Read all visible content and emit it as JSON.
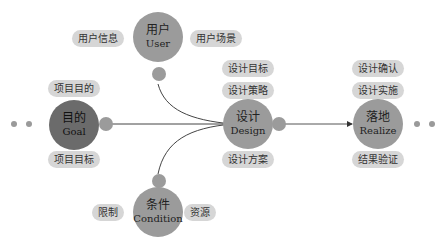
{
  "nodes": {
    "user": {
      "zh": "用户",
      "en": "User"
    },
    "goal": {
      "zh": "目的",
      "en": "Goal"
    },
    "design": {
      "zh": "设计",
      "en": "Design"
    },
    "realize": {
      "zh": "落地",
      "en": "Realize"
    },
    "condition": {
      "zh": "条件",
      "en": "Condition"
    }
  },
  "tags": {
    "user_left": "用户信息",
    "user_right": "用户场景",
    "goal_top": "项目目的",
    "goal_bottom": "项目目标",
    "design_top1": "设计目标",
    "design_top2": "设计策略",
    "design_bottom": "设计方案",
    "realize_top1": "设计确认",
    "realize_top2": "设计实施",
    "realize_bottom": "结果验证",
    "condition_left": "限制",
    "condition_right": "资源"
  },
  "colors": {
    "node_light": "#9b9b9b",
    "node_dark": "#6b6b6b",
    "pill": "#d6d6d6",
    "line": "#444444"
  }
}
